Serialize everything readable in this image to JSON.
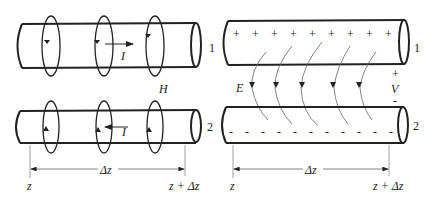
{
  "left_panel": {
    "title": "Magnetic field around two-wire line",
    "conductor_top_label": "1",
    "conductor_bottom_label": "2",
    "current_top_label": "I",
    "current_bottom_label": "I",
    "field_label": "H",
    "z_label": "z",
    "dz_label": "Δz",
    "z_plus_dz_label": "z + Δz"
  },
  "right_panel": {
    "title": "Electric field between two-wire line",
    "conductor_top_label": "1",
    "conductor_bottom_label": "2",
    "field_label": "E",
    "voltage_label": "V",
    "voltage_plus": "+",
    "voltage_minus": "-",
    "top_charges": [
      "+",
      "+",
      "+",
      "+",
      "+",
      "+",
      "+",
      "+",
      "+"
    ],
    "bottom_charges": [
      "-",
      "-",
      "-",
      "-",
      "-",
      "-",
      "-",
      "-",
      "-",
      "-",
      "-"
    ],
    "z_label": "z",
    "dz_label": "Δz",
    "z_plus_dz_label": "z + Δz"
  },
  "colors": {
    "stroke": "#222222",
    "thin_line": "#777777",
    "background": "#ffffff"
  }
}
